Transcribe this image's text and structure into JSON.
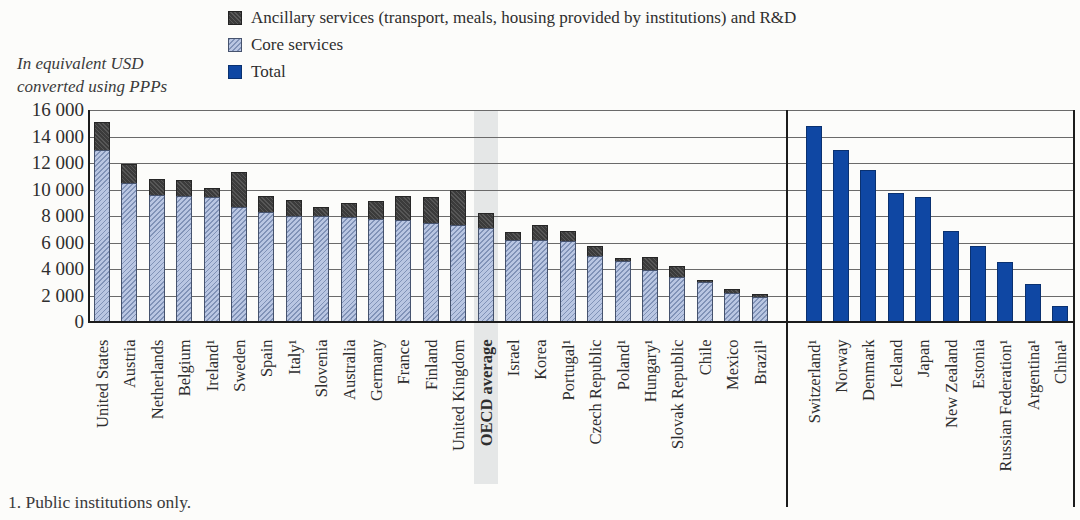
{
  "chart_data": {
    "type": "bar",
    "title": "",
    "ylabel_lines": [
      "In equivalent USD",
      "converted using PPPs"
    ],
    "ylim": [
      0,
      16000
    ],
    "ytick_step": 2000,
    "ytick_labels": [
      "16 000",
      "14 000",
      "12 000",
      "10 000",
      "8 000",
      "6 000",
      "4 000",
      "2 000",
      "0"
    ],
    "grid": "horizontal",
    "legend_position": "top",
    "legend": [
      {
        "label": "Ancillary services (transport, meals, housing provided by institutions) and R&D",
        "color": "#3b3b3b"
      },
      {
        "label": "Core services",
        "color": "#b9c6e2"
      },
      {
        "label": "Total",
        "color": "#0f47a3"
      }
    ],
    "left_panel": {
      "style": "stacked",
      "stack_order": [
        "core",
        "ancillary"
      ],
      "highlight_category": "OECD average",
      "bars": [
        {
          "label": "United States",
          "core": 13000,
          "total": 15100
        },
        {
          "label": "Austria",
          "core": 10500,
          "total": 11900
        },
        {
          "label": "Netherlands",
          "core": 9600,
          "total": 10800
        },
        {
          "label": "Belgium",
          "core": 9500,
          "total": 10700
        },
        {
          "label": "Ireland¹",
          "core": 9400,
          "total": 10100
        },
        {
          "label": "Sweden",
          "core": 8700,
          "total": 11300
        },
        {
          "label": "Spain",
          "core": 8300,
          "total": 9500
        },
        {
          "label": "Italy¹",
          "core": 8000,
          "total": 9200
        },
        {
          "label": "Slovenia",
          "core": 8000,
          "total": 8700
        },
        {
          "label": "Australia",
          "core": 7900,
          "total": 9000
        },
        {
          "label": "Germany",
          "core": 7800,
          "total": 9100
        },
        {
          "label": "France",
          "core": 7700,
          "total": 9500
        },
        {
          "label": "Finland",
          "core": 7500,
          "total": 9400
        },
        {
          "label": "United Kingdom",
          "core": 7300,
          "total": 10000
        },
        {
          "label": "OECD average",
          "core": 7100,
          "total": 8200
        },
        {
          "label": "Israel",
          "core": 6200,
          "total": 6800
        },
        {
          "label": "Korea",
          "core": 6200,
          "total": 7300
        },
        {
          "label": "Portugal¹",
          "core": 6100,
          "total": 6900
        },
        {
          "label": "Czech Republic",
          "core": 5000,
          "total": 5700
        },
        {
          "label": "Poland¹",
          "core": 4600,
          "total": 4800
        },
        {
          "label": "Hungary¹",
          "core": 3900,
          "total": 4900
        },
        {
          "label": "Slovak Republic",
          "core": 3400,
          "total": 4200
        },
        {
          "label": "Chile",
          "core": 3000,
          "total": 3200
        },
        {
          "label": "Mexico",
          "core": 2200,
          "total": 2500
        },
        {
          "label": "Brazil¹",
          "core": 1900,
          "total": 2100
        }
      ]
    },
    "right_panel": {
      "style": "total_only",
      "bars": [
        {
          "label": "Switzerland¹",
          "total": 14800
        },
        {
          "label": "Norway",
          "total": 13000
        },
        {
          "label": "Denmark",
          "total": 11500
        },
        {
          "label": "Iceland",
          "total": 9700
        },
        {
          "label": "Japan",
          "total": 9400
        },
        {
          "label": "New Zealand",
          "total": 6900
        },
        {
          "label": "Estonia",
          "total": 5700
        },
        {
          "label": "Russian Federation¹",
          "total": 4500
        },
        {
          "label": "Argentina¹",
          "total": 2900
        },
        {
          "label": "China¹",
          "total": 1200
        }
      ]
    },
    "footnote": "1. Public institutions only."
  },
  "colors": {
    "ancillary": "#3b3b3b",
    "core_fill": "#b9c6e2",
    "core_hatch": "#5d76a8",
    "total": "#0f47a3",
    "highlight_band": "#e5e7e7",
    "gridline": "#6a6a6a",
    "axis": "#1c1c1c",
    "background": "#fcfcfa",
    "text": "#2e2e2e"
  }
}
